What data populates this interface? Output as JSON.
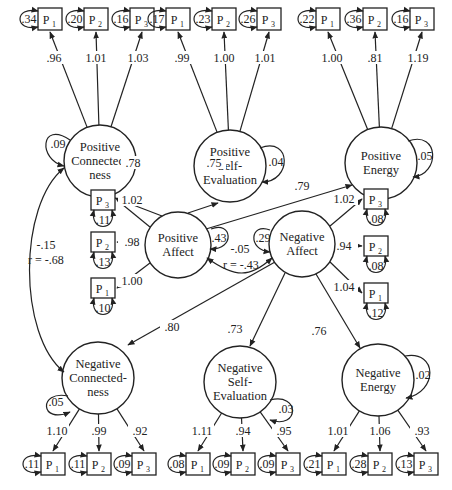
{
  "diagram": {
    "type": "structural-equation-model",
    "colors": {
      "stroke": "#222222",
      "background": "#ffffff"
    },
    "latent_factors": [
      {
        "id": "pos_conn",
        "label_lines": [
          "Positive",
          "Connected-",
          "ness"
        ],
        "residual": ".09",
        "cx": 100,
        "cy": 161,
        "r": 36,
        "indicators": [
          {
            "name": "P",
            "sub": "1",
            "error": ".34",
            "loading": ".96"
          },
          {
            "name": "P",
            "sub": "2",
            "error": ".20",
            "loading": "1.01"
          },
          {
            "name": "P",
            "sub": "3",
            "error": ".16",
            "loading": "1.03"
          }
        ]
      },
      {
        "id": "pos_self",
        "label_lines": [
          "Positive",
          "Self-",
          "Evaluation"
        ],
        "residual": ".04",
        "cx": 230,
        "cy": 166,
        "r": 36,
        "indicators": [
          {
            "name": "P",
            "sub": "1",
            "error": ".17",
            "loading": ".99"
          },
          {
            "name": "P",
            "sub": "2",
            "error": ".23",
            "loading": "1.00"
          },
          {
            "name": "P",
            "sub": "3",
            "error": ".26",
            "loading": "1.01"
          }
        ]
      },
      {
        "id": "pos_energy",
        "label_lines": [
          "Positive",
          "Energy"
        ],
        "residual": ".05",
        "cx": 381,
        "cy": 163,
        "r": 36,
        "indicators": [
          {
            "name": "P",
            "sub": "1",
            "error": ".22",
            "loading": "1.00"
          },
          {
            "name": "P",
            "sub": "2",
            "error": ".36",
            "loading": ".81"
          },
          {
            "name": "P",
            "sub": "3",
            "error": ".16",
            "loading": "1.19"
          }
        ]
      },
      {
        "id": "neg_conn",
        "label_lines": [
          "Negative",
          "Connected-",
          "ness"
        ],
        "residual": ".05",
        "cx": 98,
        "cy": 378,
        "r": 36,
        "indicators": [
          {
            "name": "P",
            "sub": "1",
            "error": ".11",
            "loading": "1.10"
          },
          {
            "name": "P",
            "sub": "2",
            "error": ".11",
            "loading": ".99"
          },
          {
            "name": "P",
            "sub": "3",
            "error": ".09",
            "loading": ".92"
          }
        ]
      },
      {
        "id": "neg_self",
        "label_lines": [
          "Negative",
          "Self-",
          "Evaluation"
        ],
        "residual": ".03",
        "cx": 240,
        "cy": 382,
        "r": 36,
        "indicators": [
          {
            "name": "P",
            "sub": "1",
            "error": ".08",
            "loading": "1.11"
          },
          {
            "name": "P",
            "sub": "2",
            "error": ".09",
            "loading": ".94"
          },
          {
            "name": "P",
            "sub": "3",
            "error": ".09",
            "loading": ".95"
          }
        ]
      },
      {
        "id": "neg_energy",
        "label_lines": [
          "Negative",
          "Energy"
        ],
        "residual": ".02",
        "cx": 378,
        "cy": 380,
        "r": 36,
        "indicators": [
          {
            "name": "P",
            "sub": "1",
            "error": ".21",
            "loading": "1.01"
          },
          {
            "name": "P",
            "sub": "2",
            "error": ".28",
            "loading": "1.06"
          },
          {
            "name": "P",
            "sub": "3",
            "error": ".13",
            "loading": ".93"
          }
        ]
      }
    ],
    "higher_order": [
      {
        "id": "pos_affect",
        "label_lines": [
          "Positive",
          "Affect"
        ],
        "residual": ".43",
        "indicators": [
          {
            "name": "P",
            "sub": "3",
            "error": ".11",
            "loading": "1.02"
          },
          {
            "name": "P",
            "sub": "2",
            "error": ".13",
            "loading": ".98"
          },
          {
            "name": "P",
            "sub": "1",
            "error": ".10",
            "loading": "1.00"
          }
        ]
      },
      {
        "id": "neg_affect",
        "label_lines": [
          "Negative",
          "Affect"
        ],
        "residual": ".29",
        "indicators": [
          {
            "name": "P",
            "sub": "3",
            "error": ".08",
            "loading": "1.02"
          },
          {
            "name": "P",
            "sub": "2",
            "error": ".08",
            "loading": ".94"
          },
          {
            "name": "P",
            "sub": "1",
            "error": ".12",
            "loading": "1.04"
          }
        ]
      }
    ],
    "paths": {
      "pos_affect_to_pos_conn": ".78",
      "pos_affect_to_pos_self": ".75",
      "pos_affect_to_pos_energy": ".79",
      "neg_affect_to_neg_conn": ".80",
      "neg_affect_to_neg_self": ".73",
      "neg_affect_to_neg_energy": ".76"
    },
    "covariances": {
      "affect": {
        "cov": "-.05",
        "r": "r = -.43"
      },
      "connectedness": {
        "cov": "-.15",
        "r": "r = -.68"
      }
    }
  }
}
